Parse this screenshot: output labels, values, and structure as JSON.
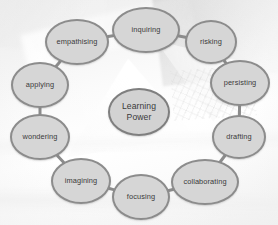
{
  "diagram": {
    "type": "cycle",
    "title": "Learning Power",
    "center": {
      "id": "learning-power",
      "label": "Learning\nPower",
      "line1": "Learning",
      "line2": "Power"
    },
    "style": {
      "node_fill": "#d6d6d6",
      "node_border": "#8c8c8c",
      "node_text": "#3a3a3a",
      "link_color": "#8c8c8c",
      "background": "#f4f4f4"
    },
    "nodes": [
      {
        "id": "inquiring",
        "label": "inquiring",
        "x": 146,
        "y": 30,
        "rx": 34,
        "ry": 23
      },
      {
        "id": "risking",
        "label": "risking",
        "x": 211,
        "y": 42,
        "rx": 26,
        "ry": 22
      },
      {
        "id": "persisting",
        "label": "persisting",
        "x": 240,
        "y": 83,
        "rx": 30,
        "ry": 23
      },
      {
        "id": "drafting",
        "label": "drafting",
        "x": 239,
        "y": 137,
        "rx": 27,
        "ry": 22
      },
      {
        "id": "collaborating",
        "label": "collaborating",
        "x": 205,
        "y": 182,
        "rx": 34,
        "ry": 23
      },
      {
        "id": "focusing",
        "label": "focusing",
        "x": 141,
        "y": 197,
        "rx": 29,
        "ry": 23
      },
      {
        "id": "imagining",
        "label": "imagining",
        "x": 81,
        "y": 181,
        "rx": 30,
        "ry": 23
      },
      {
        "id": "wondering",
        "label": "wondering",
        "x": 40,
        "y": 137,
        "rx": 30,
        "ry": 23
      },
      {
        "id": "applying",
        "label": "applying",
        "x": 40,
        "y": 85,
        "rx": 29,
        "ry": 23
      },
      {
        "id": "empathising",
        "label": "empathising",
        "x": 77,
        "y": 42,
        "rx": 32,
        "ry": 23
      }
    ],
    "links": [
      {
        "from": "empathising",
        "to": "inquiring"
      },
      {
        "from": "inquiring",
        "to": "risking"
      },
      {
        "from": "risking",
        "to": "persisting"
      },
      {
        "from": "persisting",
        "to": "drafting"
      },
      {
        "from": "drafting",
        "to": "collaborating"
      },
      {
        "from": "collaborating",
        "to": "focusing"
      },
      {
        "from": "focusing",
        "to": "imagining"
      },
      {
        "from": "imagining",
        "to": "wondering"
      },
      {
        "from": "wondering",
        "to": "applying"
      },
      {
        "from": "applying",
        "to": "empathising"
      }
    ]
  }
}
